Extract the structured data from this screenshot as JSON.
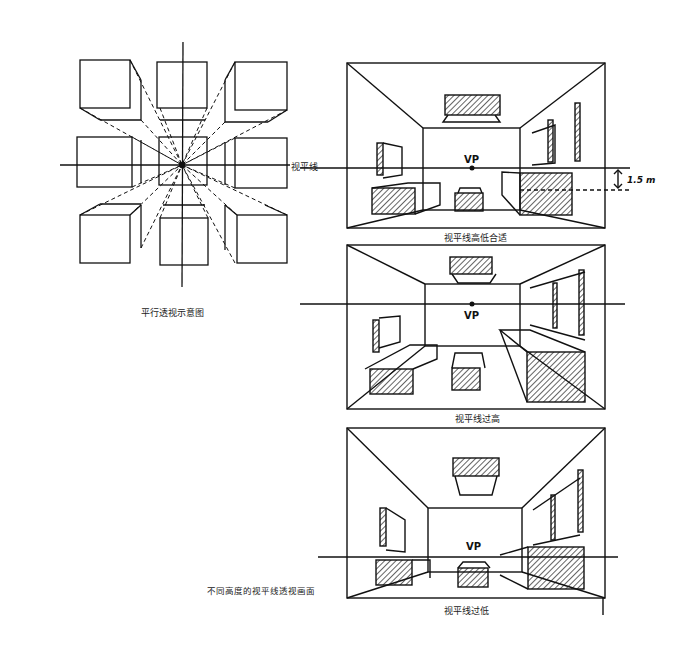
{
  "figure": {
    "left_diagram": {
      "caption": "平行透视示意图",
      "description": "9 cubes arranged in a 3x3 grid converging to a central vanishing point",
      "horizon_label": "视平线"
    },
    "right_diagrams": [
      {
        "id": "appropriate",
        "caption": "视平线高低合适",
        "vp_label": "VP",
        "horizon_label": "视平线",
        "measurement": "1.5 m"
      },
      {
        "id": "too-high",
        "caption": "视平线过高",
        "vp_label": "VP"
      },
      {
        "id": "too-low",
        "caption": "视平线过低",
        "vp_label": "VP"
      }
    ],
    "group_caption": "不同高度的视平线透视画面"
  },
  "colors": {
    "ink": "#111111",
    "paper": "#ffffff"
  }
}
